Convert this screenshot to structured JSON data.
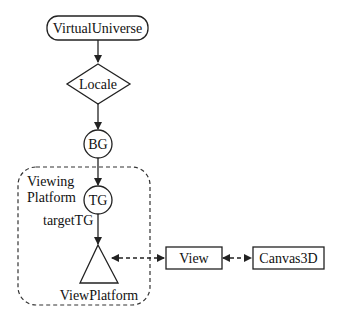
{
  "diagram": {
    "type": "scene-graph",
    "nodes": {
      "virtual_universe": {
        "label": "VirtualUniverse",
        "shape": "rounded-rect"
      },
      "locale": {
        "label": "Locale",
        "shape": "diamond"
      },
      "bg": {
        "label": "BG",
        "shape": "circle"
      },
      "tg": {
        "label": "TG",
        "shape": "circle"
      },
      "view_platform": {
        "label": "ViewPlatform",
        "shape": "triangle"
      },
      "view": {
        "label": "View",
        "shape": "rect"
      },
      "canvas3d": {
        "label": "Canvas3D",
        "shape": "rect"
      }
    },
    "group": {
      "label_line1": "Viewing",
      "label_line2": "Platform",
      "style": "dashed-rounded-rect"
    },
    "annotations": {
      "target_tg": "targetTG"
    },
    "edges": [
      {
        "from": "VirtualUniverse",
        "to": "Locale",
        "style": "solid-arrow"
      },
      {
        "from": "Locale",
        "to": "BG",
        "style": "solid-arrow"
      },
      {
        "from": "BG",
        "to": "TG",
        "style": "solid-arrow"
      },
      {
        "from": "TG",
        "to": "ViewPlatform",
        "style": "solid-arrow"
      },
      {
        "from": "ViewPlatform",
        "to": "View",
        "style": "dashed-bidirectional"
      },
      {
        "from": "View",
        "to": "Canvas3D",
        "style": "dashed-bidirectional"
      }
    ],
    "colors": {
      "stroke": "#222222",
      "background": "#ffffff"
    }
  }
}
